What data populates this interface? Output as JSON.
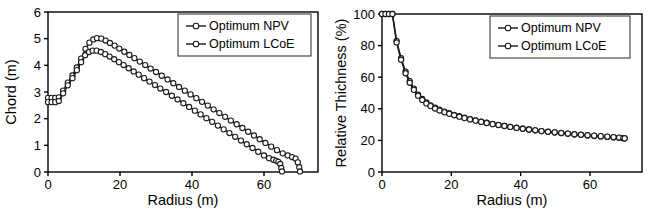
{
  "figure": {
    "panels": [
      "chord-vs-radius",
      "relative-thickness-vs-radius"
    ]
  },
  "chart_data": [
    {
      "type": "line",
      "id": "chord-vs-radius",
      "title": "",
      "xlabel": "Radius (m)",
      "ylabel": "Chord (m)",
      "xlim": [
        0,
        75
      ],
      "ylim": [
        0,
        6
      ],
      "xticks": [
        0,
        20,
        40,
        60
      ],
      "yticks": [
        0,
        1,
        2,
        3,
        4,
        5,
        6
      ],
      "xticklabels": [
        "0",
        "20",
        "40",
        "60"
      ],
      "yticklabels": [
        "0",
        "1",
        "2",
        "3",
        "4",
        "5",
        "6"
      ],
      "grid": false,
      "legend_position": "upper right",
      "marker": "open-circle",
      "series": [
        {
          "name": "Optimum NPV",
          "x": [
            0.0,
            1.0,
            2.0,
            3.0,
            4.2,
            5.5,
            6.8,
            8.0,
            9.2,
            10.4,
            11.5,
            12.6,
            13.6,
            14.8,
            16.0,
            17.2,
            18.5,
            19.8,
            21.2,
            22.6,
            24.0,
            25.5,
            27.0,
            28.5,
            30.0,
            31.6,
            33.2,
            34.8,
            36.4,
            38.0,
            39.6,
            41.2,
            42.8,
            44.4,
            46.0,
            47.6,
            49.2,
            50.8,
            52.4,
            54.0,
            55.6,
            57.2,
            58.8,
            60.4,
            62.0,
            63.6,
            65.2,
            66.6,
            67.8,
            68.8,
            69.4,
            69.8,
            70.0
          ],
          "y": [
            2.78,
            2.78,
            2.78,
            2.8,
            3.05,
            3.35,
            3.62,
            3.92,
            4.25,
            4.62,
            4.85,
            4.97,
            5.02,
            5.0,
            4.93,
            4.84,
            4.74,
            4.63,
            4.51,
            4.39,
            4.27,
            4.14,
            4.01,
            3.88,
            3.75,
            3.61,
            3.47,
            3.33,
            3.19,
            3.05,
            2.91,
            2.77,
            2.63,
            2.49,
            2.35,
            2.21,
            2.07,
            1.93,
            1.79,
            1.65,
            1.51,
            1.37,
            1.23,
            1.09,
            0.95,
            0.82,
            0.7,
            0.62,
            0.56,
            0.5,
            0.36,
            0.18,
            0.02
          ]
        },
        {
          "name": "Optimum LCoE",
          "x": [
            0.0,
            1.0,
            2.0,
            3.0,
            4.2,
            5.5,
            6.8,
            8.0,
            9.2,
            10.3,
            11.4,
            12.4,
            13.5,
            14.7,
            15.9,
            17.1,
            18.4,
            19.7,
            21.0,
            22.4,
            23.8,
            25.2,
            26.7,
            28.2,
            29.7,
            31.2,
            32.8,
            34.4,
            36.0,
            37.6,
            39.2,
            40.8,
            42.4,
            44.0,
            45.6,
            47.2,
            48.8,
            50.4,
            52.0,
            53.6,
            55.2,
            56.8,
            58.4,
            60.0,
            61.4,
            62.6,
            63.4,
            64.0,
            64.5,
            64.8,
            65.0
          ],
          "y": [
            2.62,
            2.62,
            2.62,
            2.66,
            2.95,
            3.25,
            3.52,
            3.82,
            4.12,
            4.38,
            4.5,
            4.55,
            4.55,
            4.5,
            4.42,
            4.33,
            4.23,
            4.12,
            4.01,
            3.89,
            3.77,
            3.65,
            3.52,
            3.39,
            3.26,
            3.13,
            3.0,
            2.86,
            2.72,
            2.58,
            2.44,
            2.3,
            2.16,
            2.02,
            1.88,
            1.74,
            1.6,
            1.46,
            1.32,
            1.18,
            1.04,
            0.9,
            0.76,
            0.62,
            0.52,
            0.46,
            0.42,
            0.38,
            0.3,
            0.15,
            0.02
          ]
        }
      ]
    },
    {
      "type": "line",
      "id": "relative-thickness-vs-radius",
      "title": "",
      "xlabel": "Radius (m)",
      "ylabel": "Relative Thichness (%)",
      "xlim": [
        0,
        75
      ],
      "ylim": [
        0,
        100
      ],
      "xticks": [
        0,
        20,
        40,
        60
      ],
      "yticks": [
        0,
        20,
        40,
        60,
        80,
        100
      ],
      "xticklabels": [
        "0",
        "20",
        "40",
        "60"
      ],
      "yticklabels": [
        "0",
        "20",
        "40",
        "60",
        "80",
        "100"
      ],
      "grid": false,
      "legend_position": "upper right",
      "marker": "open-circle",
      "series": [
        {
          "name": "Optimum NPV",
          "x": [
            0.0,
            1.0,
            2.0,
            3.0,
            4.2,
            5.5,
            6.8,
            8.0,
            9.2,
            10.4,
            11.6,
            12.8,
            14.0,
            15.3,
            16.6,
            18.0,
            19.4,
            20.8,
            22.3,
            23.8,
            25.4,
            27.0,
            28.6,
            30.2,
            31.9,
            33.6,
            35.3,
            37.0,
            38.8,
            40.6,
            42.4,
            44.2,
            46.0,
            47.9,
            49.8,
            51.7,
            53.6,
            55.5,
            57.4,
            59.3,
            61.2,
            63.1,
            65.0,
            66.8,
            68.4,
            69.6,
            70.0
          ],
          "y": [
            100,
            100,
            100,
            100,
            83.0,
            72.0,
            63.5,
            57.5,
            52.8,
            49.0,
            46.2,
            44.0,
            42.2,
            40.7,
            39.4,
            38.2,
            37.2,
            36.2,
            35.3,
            34.4,
            33.5,
            32.7,
            31.9,
            31.2,
            30.5,
            29.8,
            29.2,
            28.6,
            28.0,
            27.4,
            26.9,
            26.4,
            25.9,
            25.4,
            25.0,
            24.6,
            24.2,
            23.8,
            23.5,
            23.1,
            22.8,
            22.5,
            22.2,
            21.9,
            21.6,
            21.4,
            21.3
          ]
        },
        {
          "name": "Optimum LCoE",
          "x": [
            0.0,
            1.0,
            2.0,
            3.0,
            4.2,
            5.5,
            6.8,
            8.0,
            9.2,
            10.4,
            11.6,
            12.8,
            14.0,
            15.3,
            16.6,
            18.0,
            19.4,
            20.8,
            22.3,
            23.8,
            25.4,
            27.0,
            28.6,
            30.2,
            31.9,
            33.6,
            35.3,
            37.0,
            38.8,
            40.6,
            42.4,
            44.2,
            46.0,
            47.9,
            49.8,
            51.7,
            53.6,
            55.5,
            57.4,
            59.3,
            61.2,
            63.1,
            65.0,
            66.8,
            68.4,
            69.6,
            70.0
          ],
          "y": [
            100,
            100,
            100,
            100,
            82.0,
            71.0,
            62.5,
            56.5,
            52.0,
            48.3,
            45.6,
            43.4,
            41.7,
            40.2,
            38.9,
            37.8,
            36.8,
            35.9,
            35.0,
            34.1,
            33.3,
            32.5,
            31.7,
            31.0,
            30.3,
            29.7,
            29.1,
            28.5,
            27.9,
            27.4,
            26.9,
            26.4,
            25.9,
            25.5,
            25.1,
            24.7,
            24.3,
            23.9,
            23.6,
            23.3,
            23.0,
            22.7,
            22.4,
            22.1,
            21.8,
            21.5,
            21.3
          ]
        }
      ]
    }
  ]
}
